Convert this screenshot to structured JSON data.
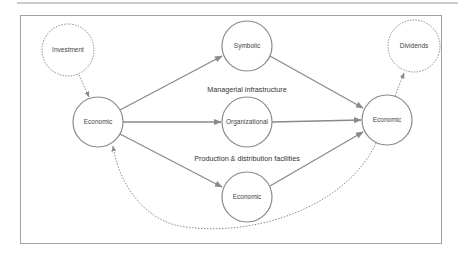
{
  "diagram": {
    "nodes": [
      {
        "id": "investment",
        "label": "Investment",
        "style": "dotted",
        "cx": 68,
        "cy": 50,
        "r": 26
      },
      {
        "id": "economic_left",
        "label": "Economic",
        "style": "solid",
        "cx": 98,
        "cy": 122,
        "r": 25
      },
      {
        "id": "symbolic",
        "label": "Symbolic",
        "style": "solid",
        "cx": 247,
        "cy": 46,
        "r": 25
      },
      {
        "id": "organizational",
        "label": "Organizational",
        "style": "solid",
        "cx": 247,
        "cy": 122,
        "r": 25
      },
      {
        "id": "economic_bottom",
        "label": "Economic",
        "style": "solid",
        "cx": 247,
        "cy": 197,
        "r": 25
      },
      {
        "id": "economic_right",
        "label": "Economic",
        "style": "solid",
        "cx": 387,
        "cy": 120,
        "r": 25
      },
      {
        "id": "dividends",
        "label": "Dividends",
        "style": "dotted",
        "cx": 414,
        "cy": 46,
        "r": 26
      }
    ],
    "section_labels": {
      "managerial": "Managerial infrastructure",
      "production": "Production & distribution facilities"
    },
    "edges": [
      {
        "from": "investment",
        "to": "economic_left",
        "style": "dotted"
      },
      {
        "from": "economic_left",
        "to": "symbolic",
        "style": "solid"
      },
      {
        "from": "economic_left",
        "to": "organizational",
        "style": "solid"
      },
      {
        "from": "economic_left",
        "to": "economic_bottom",
        "style": "solid"
      },
      {
        "from": "symbolic",
        "to": "economic_right",
        "style": "solid"
      },
      {
        "from": "organizational",
        "to": "economic_right",
        "style": "solid"
      },
      {
        "from": "economic_bottom",
        "to": "economic_right",
        "style": "solid"
      },
      {
        "from": "economic_right",
        "to": "dividends",
        "style": "dotted"
      },
      {
        "from": "economic_right",
        "to": "economic_left",
        "style": "dotted-curve"
      }
    ],
    "colors": {
      "line": "#8a8a8a",
      "frame": "#9a9a9a",
      "text": "#444444"
    }
  }
}
